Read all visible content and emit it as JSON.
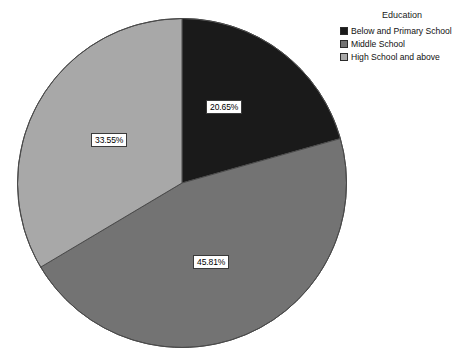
{
  "chart_data": {
    "type": "pie",
    "title": "",
    "legend_title": "Education",
    "legend_position": "top-right",
    "categories": [
      "Below and Primary School",
      "Middle School",
      "High School and above"
    ],
    "values": [
      20.65,
      45.81,
      33.55
    ],
    "labels": [
      "20.65%",
      "45.81%",
      "33.55%"
    ],
    "colors": [
      "#1a1a1a",
      "#737373",
      "#a8a8a8"
    ],
    "units": "percent",
    "start_angle_deg": 0,
    "direction": "clockwise",
    "slices": [
      {
        "name": "Below and Primary School",
        "value": 20.65,
        "label": "20.65%",
        "color": "#1a1a1a"
      },
      {
        "name": "Middle School",
        "value": 45.81,
        "label": "45.81%",
        "color": "#737373"
      },
      {
        "name": "High School and above",
        "value": 33.55,
        "label": "33.55%",
        "color": "#a8a8a8"
      }
    ]
  },
  "legend": {
    "title": "Education",
    "items": [
      {
        "label": "Below and Primary School",
        "color": "#1a1a1a"
      },
      {
        "label": "Middle School",
        "color": "#737373"
      },
      {
        "label": "High School and above",
        "color": "#a8a8a8"
      }
    ]
  },
  "pie": {
    "outline_color": "#4a4a4a",
    "background": "#ffffff"
  }
}
